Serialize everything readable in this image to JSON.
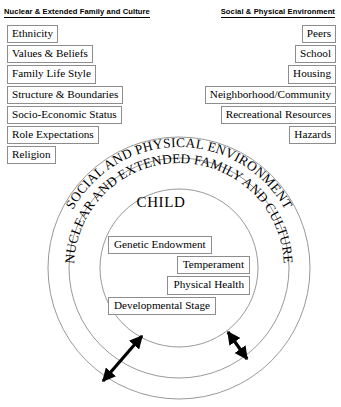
{
  "columns": {
    "left": {
      "heading": "Nuclear & Extended Family and Culture",
      "items": [
        "Ethnicity",
        "Values & Beliefs",
        "Family Life Style",
        "Structure & Boundaries",
        "Socio-Economic Status",
        "Role Expectations",
        "Religion"
      ]
    },
    "right": {
      "heading": "Social & Physical Environment",
      "items": [
        "Peers",
        "School",
        "Housing",
        "Neighborhood/Community",
        "Recreational Resources",
        "Hazards"
      ]
    }
  },
  "diagram": {
    "outer_ring_label": "SOCIAL AND PHYSICAL ENVIRONMENT",
    "middle_ring_label": "NUCLEAR AND EXTENDED FAMILY AND CULTURE",
    "inner_circle_label": "CHILD",
    "child_attributes": [
      "Genetic Endowment",
      "Temperament",
      "Physical Health",
      "Developmental Stage"
    ],
    "arrows": [
      "bidirectional-arrow-left",
      "bidirectional-arrow-right"
    ]
  },
  "colors": {
    "stroke": "#000000",
    "circle_stroke": "#8d8d8d",
    "box_border": "#8d8d8d",
    "background": "#ffffff"
  }
}
